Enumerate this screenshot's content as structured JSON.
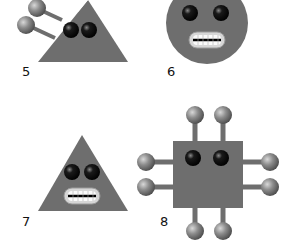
{
  "figures": [
    {
      "id": "5",
      "label": "5",
      "shape": "triangle",
      "features": [
        "eyes",
        "antennae-left"
      ]
    },
    {
      "id": "6",
      "label": "6",
      "shape": "circle",
      "features": [
        "eyes",
        "teeth-mouth"
      ]
    },
    {
      "id": "7",
      "label": "7",
      "shape": "triangle",
      "features": [
        "eyes",
        "teeth-mouth"
      ]
    },
    {
      "id": "8",
      "label": "8",
      "shape": "square",
      "features": [
        "eyes",
        "antennae-top",
        "antennae-bottom",
        "antennae-left",
        "antennae-right"
      ]
    }
  ],
  "colors": {
    "body": "#6e6e6e",
    "ball": "#8a8a8a",
    "eye": "#111111",
    "teeth": "#f2f2f2",
    "lip": "#cfcfcf"
  }
}
